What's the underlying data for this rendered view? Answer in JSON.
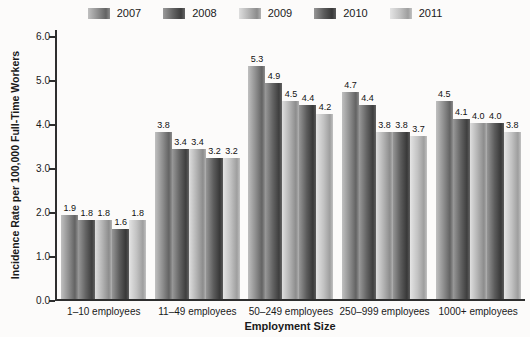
{
  "chart_data": {
    "type": "bar",
    "title": "",
    "xlabel": "Employment Size",
    "ylabel": "Incidence Rate per 100,000 Full-Time Workers",
    "ylim": [
      0,
      6
    ],
    "ytick_step": 1,
    "ytick_labels": [
      "0.0",
      "1.0",
      "2.0",
      "3.0",
      "4.0",
      "5.0",
      "6.0"
    ],
    "grid": false,
    "legend_position": "top",
    "axis_color": "#2e2e2e",
    "background_color": "#fcfbfa",
    "categories": [
      "1–10 employees",
      "11–49 employees",
      "50–249 employees",
      "250–999 employees",
      "1000+ employees"
    ],
    "series": [
      {
        "name": "2007",
        "values": [
          1.9,
          3.8,
          5.3,
          4.7,
          4.5
        ],
        "color": {
          "light": "#c0c0c0",
          "mid": "#8e8e8e",
          "dark": "#636363"
        }
      },
      {
        "name": "2008",
        "values": [
          1.8,
          3.4,
          4.9,
          4.4,
          4.1
        ],
        "color": {
          "light": "#9a9a9a",
          "mid": "#646464",
          "dark": "#3e3e3e"
        }
      },
      {
        "name": "2009",
        "values": [
          1.8,
          3.4,
          4.5,
          3.8,
          4.0
        ],
        "color": {
          "light": "#dedede",
          "mid": "#b2b2b2",
          "dark": "#8c8c8c"
        }
      },
      {
        "name": "2010",
        "values": [
          1.6,
          3.2,
          4.4,
          3.8,
          4.0
        ],
        "color": {
          "light": "#969696",
          "mid": "#5c5c5c",
          "dark": "#383838"
        }
      },
      {
        "name": "2011",
        "values": [
          1.8,
          3.2,
          4.2,
          3.7,
          3.8
        ],
        "color": {
          "light": "#e4e4e4",
          "mid": "#c2c2c2",
          "dark": "#9e9e9e"
        }
      }
    ]
  }
}
